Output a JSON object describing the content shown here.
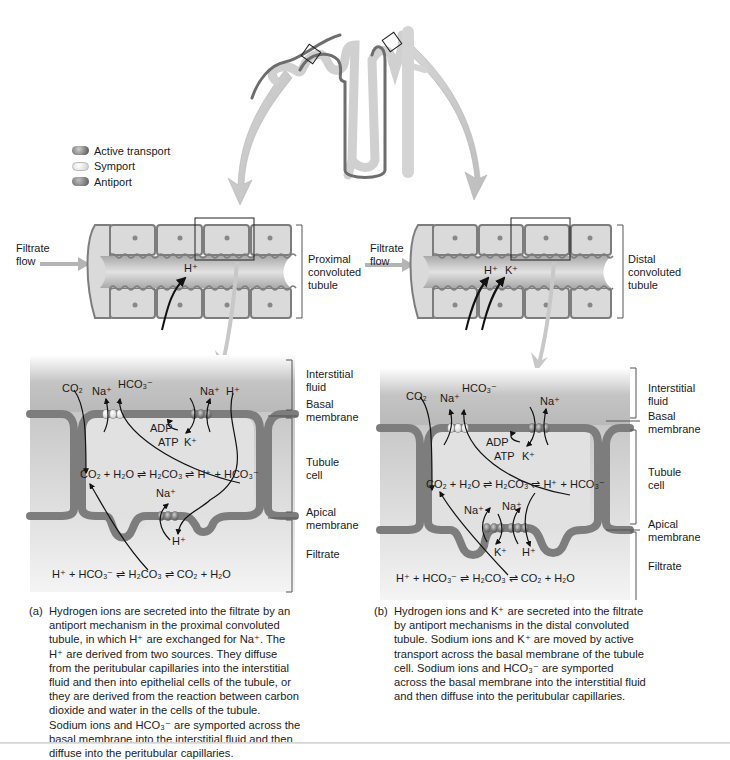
{
  "legend": {
    "items": [
      {
        "label": "Active transport",
        "color": "#555555",
        "icon": "active-transport-pill"
      },
      {
        "label": "Symport",
        "color": "#e6e6e6",
        "icon": "symport-pill"
      },
      {
        "label": "Antiport",
        "color": "#666666",
        "icon": "antiport-pill"
      }
    ]
  },
  "colors": {
    "membrane": "#7d7d7d",
    "cell_fill": "#dcdcdc",
    "interstitial": "#bdbdbd",
    "filtrate": "#d6d6d6",
    "arrow_callout": "#c8c8c8",
    "lumen": "#c9c9c9"
  },
  "panel_a": {
    "flow_label": "Filtrate\nflow",
    "flow_line1": "Filtrate",
    "flow_line2": "flow",
    "segment_label_1": "Proximal",
    "segment_label_2": "convoluted",
    "segment_label_3": "tubule",
    "lumen_ions": [
      "H⁺"
    ],
    "regions": {
      "interstitial_1": "Interstitial",
      "interstitial_2": "fluid",
      "basal_1": "Basal",
      "basal_2": "membrane",
      "cell_1": "Tubule",
      "cell_2": "cell",
      "apical_1": "Apical",
      "apical_2": "membrane",
      "filtrate": "Filtrate"
    },
    "ions": {
      "co2": "CO₂",
      "na_symport": "Na⁺",
      "hco3": "HCO₃⁻",
      "na_active": "Na⁺",
      "h_interstitial": "H⁺",
      "adp": "ADP",
      "atp": "ATP",
      "k": "K⁺",
      "na_apical": "Na⁺",
      "h_filtrate": "H⁺"
    },
    "cell_equation": "CO₂ + H₂O ⇌ H₂CO₃ ⇌ H⁺ + HCO₃⁻",
    "filtrate_equation": "H⁺ + HCO₃⁻ ⇌ H₂CO₃ ⇌ CO₂ + H₂O",
    "caption_tag": "(a)",
    "caption": "Hydrogen ions are secreted into the filtrate by an antiport mechanism in the proximal convoluted tubule, in which H⁺ are exchanged for Na⁺. The H⁺ are derived from two sources. They diffuse from the peritubular capillaries into the interstitial fluid and then into epithelial cells of the tubule, or they are derived from the reaction between carbon dioxide and water in the cells of the tubule. Sodium ions and HCO₃⁻ are symported across the basal membrane into the interstitial fluid and then diffuse into the peritubular capillaries."
  },
  "panel_b": {
    "flow_line1": "Filtrate",
    "flow_line2": "flow",
    "segment_label_1": "Distal",
    "segment_label_2": "convoluted",
    "segment_label_3": "tubule",
    "lumen_ions": [
      "H⁺",
      "K⁺"
    ],
    "regions": {
      "interstitial_1": "Interstitial",
      "interstitial_2": "fluid",
      "basal_1": "Basal",
      "basal_2": "membrane",
      "cell_1": "Tubule",
      "cell_2": "cell",
      "apical_1": "Apical",
      "apical_2": "membrane",
      "filtrate": "Filtrate"
    },
    "ions": {
      "co2": "CO₂",
      "na_symport": "Na⁺",
      "hco3": "HCO₃⁻",
      "na_active": "Na⁺",
      "adp": "ADP",
      "atp": "ATP",
      "k": "K⁺",
      "na_apical_1": "Na⁺",
      "na_apical_2": "Na⁺",
      "k_filtrate": "K⁺",
      "h_filtrate": "H⁺"
    },
    "cell_equation": "CO₂ + H₂O ⇌ H₂CO₃ ⇌ H⁺ + HCO₃⁻",
    "filtrate_equation": "H⁺ + HCO₃⁻ ⇌ H₂CO₃ ⇌ CO₂ + H₂O",
    "caption_tag": "(b)",
    "caption": "Hydrogen ions and K⁺ are secreted into the filtrate by antiport mechanisms in the distal convoluted tubule. Sodium ions and K⁺ are moved by active transport across the basal membrane of the tubule cell. Sodium ions and HCO₃⁻ are symported across the basal membrane into the interstitial fluid and then diffuse into the peritubular capillaries."
  }
}
